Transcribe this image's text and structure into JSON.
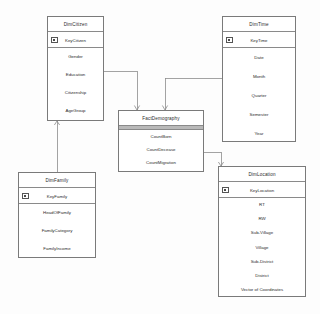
{
  "diagram": {
    "type": "entity-relationship-star-schema",
    "background": "#fdfdfd",
    "line_color": "#7a7a7a",
    "header_band_color": "#b9b9b9"
  },
  "entities": {
    "dim_citizen": {
      "title": "DimCitizen",
      "pk": "KeyCitizen",
      "attributes": [
        "Gender",
        "Education",
        "Citizenship",
        "AgeGroup"
      ]
    },
    "dim_time": {
      "title": "DimTime",
      "pk": "KeyTime",
      "attributes": [
        "Date",
        "Month",
        "Quarter",
        "Semester",
        "Year"
      ]
    },
    "fact_demography": {
      "title": "FactDemography",
      "pk": "",
      "attributes": [
        "CountBorn",
        "CountDecease",
        "CountMigration"
      ]
    },
    "dim_family": {
      "title": "DimFamily",
      "pk": "KeyFamily",
      "attributes": [
        "HeadOfFamily",
        "FamilyCategory",
        "FamilyIncome"
      ]
    },
    "dim_location": {
      "title": "DimLocation",
      "pk": "KeyLocation",
      "attributes": [
        "RT",
        "RW",
        "Sub-Village",
        "Village",
        "Sub-District",
        "District",
        "Vector of Coordinates"
      ]
    }
  },
  "relationships": [
    {
      "name": "citizen-to-fact",
      "from": "dim_citizen",
      "to": "fact_demography"
    },
    {
      "name": "time-to-fact",
      "from": "dim_time",
      "to": "fact_demography"
    },
    {
      "name": "fact-to-location",
      "from": "fact_demography",
      "to": "dim_location"
    },
    {
      "name": "family-to-citizen",
      "from": "dim_family",
      "to": "dim_citizen"
    }
  ]
}
